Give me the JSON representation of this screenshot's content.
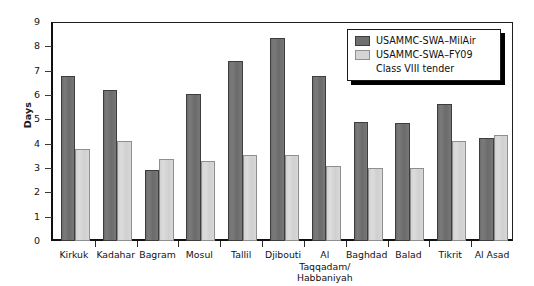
{
  "chart_data": {
    "type": "bar",
    "title": "",
    "xlabel": "",
    "ylabel": "Days",
    "ylim": [
      0,
      9
    ],
    "yticks": [
      0,
      1,
      2,
      3,
      4,
      5,
      6,
      7,
      8,
      9
    ],
    "grid": false,
    "legend_position": "top-right",
    "categories": [
      "Kirkuk",
      "Kadahar",
      "Bagram",
      "Mosul",
      "Tallil",
      "Djibouti",
      "Al Taqqadam/ Habbaniyah",
      "Baghdad",
      "Balad",
      "Tikrit",
      "Al Asad"
    ],
    "category_lines": [
      [
        "Kirkuk"
      ],
      [
        "Kadahar"
      ],
      [
        "Bagram"
      ],
      [
        "Mosul"
      ],
      [
        "Tallil"
      ],
      [
        "Djibouti"
      ],
      [
        "Al",
        "Taqqadam/",
        "Habbaniyah"
      ],
      [
        "Baghdad"
      ],
      [
        "Balad"
      ],
      [
        "Tikrit"
      ],
      [
        "Al Asad"
      ]
    ],
    "series": [
      {
        "name": "USAMMC-SWA–MilAir",
        "color": "#6f6f6f",
        "values": [
          6.8,
          6.2,
          2.9,
          6.05,
          7.4,
          8.35,
          6.8,
          4.9,
          4.85,
          5.65,
          4.25
        ]
      },
      {
        "name": "USAMMC-SWA–FY09 Class VIII tender",
        "color": "#d5d5d5",
        "values": [
          3.8,
          4.1,
          3.35,
          3.3,
          3.55,
          3.55,
          3.1,
          3.0,
          3.0,
          4.1,
          4.35
        ]
      }
    ]
  },
  "legend": {
    "entries": [
      {
        "label": "USAMMC-SWA–MilAir",
        "swatch": "dark"
      },
      {
        "label": "USAMMC-SWA–FY09",
        "swatch": "light"
      }
    ],
    "sub_label": "Class VIII tender"
  },
  "colors": {
    "series_dark": "#6f6f6f",
    "series_light": "#d5d5d5",
    "axis": "#111111",
    "background": "#ffffff"
  }
}
